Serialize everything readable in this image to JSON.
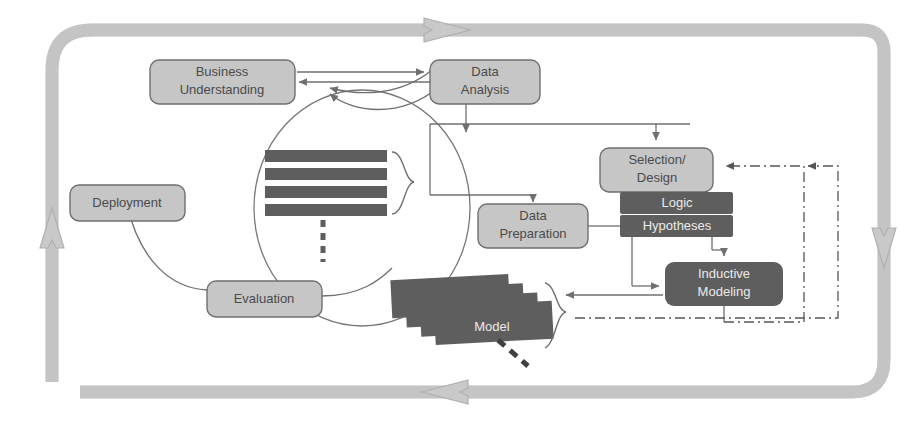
{
  "diagram": {
    "colors": {
      "outer_loop": "#c9c9c9",
      "outer_loop_stroke": "#b4b4b4",
      "node_light_fill": "#c6c6c6",
      "node_light_stroke": "#6f6f6f",
      "node_dark_fill": "#5e5e5e",
      "node_dark_stroke": "#5e5e5e",
      "connector": "#6f6f6f",
      "data_icon": "#5e5e5e",
      "label_dark": "#4a4a4a",
      "label_light": "#eceaea",
      "background": "#ffffff"
    },
    "nodes": [
      {
        "id": "business-understanding",
        "label_lines": [
          "Business",
          "Understanding"
        ],
        "style": "light",
        "x": 150,
        "y": 60,
        "w": 145,
        "h": 44
      },
      {
        "id": "data-analysis",
        "label_lines": [
          "Data",
          "Analysis"
        ],
        "style": "light",
        "x": 430,
        "y": 60,
        "w": 110,
        "h": 44
      },
      {
        "id": "selection-design",
        "label_lines": [
          "Selection/",
          "Design"
        ],
        "style": "light",
        "x": 600,
        "y": 148,
        "w": 113,
        "h": 44
      },
      {
        "id": "logic",
        "label_lines": [
          "Logic"
        ],
        "style": "dark",
        "x": 620,
        "y": 192,
        "w": 113,
        "h": 22
      },
      {
        "id": "hypotheses",
        "label_lines": [
          "Hypotheses"
        ],
        "style": "dark",
        "x": 620,
        "y": 214,
        "w": 113,
        "h": 22
      },
      {
        "id": "data-preparation",
        "label_lines": [
          "Data",
          "Preparation"
        ],
        "style": "light",
        "x": 478,
        "y": 209,
        "w": 110,
        "h": 44
      },
      {
        "id": "inductive-modeling",
        "label_lines": [
          "Inductive",
          "Modeling"
        ],
        "style": "dark",
        "x": 665,
        "y": 262,
        "w": 118,
        "h": 44
      },
      {
        "id": "deployment",
        "label_lines": [
          "Deployment"
        ],
        "style": "light",
        "x": 70,
        "y": 185,
        "w": 115,
        "h": 36
      },
      {
        "id": "evaluation",
        "label_lines": [
          "Evaluation"
        ],
        "style": "light",
        "x": 207,
        "y": 281,
        "w": 115,
        "h": 36
      }
    ],
    "icons": [
      {
        "id": "data-table-icon",
        "name": "data-table-stack",
        "x": 265,
        "y": 150,
        "rows": 4
      },
      {
        "id": "model-stack-icon",
        "name": "model-card-stack",
        "label": "Model",
        "x": 392,
        "y": 277,
        "cards": 4
      }
    ],
    "outer_loop": {
      "name": "process-cycle-band",
      "arrow_directions": [
        "right",
        "down",
        "left",
        "up"
      ]
    },
    "feedback_paths": [
      {
        "id": "model-to-selection",
        "style": "dash-dot",
        "target": "selection-design"
      },
      {
        "id": "inductive-to-selection",
        "style": "dash-dot",
        "target": "selection-design"
      }
    ]
  }
}
